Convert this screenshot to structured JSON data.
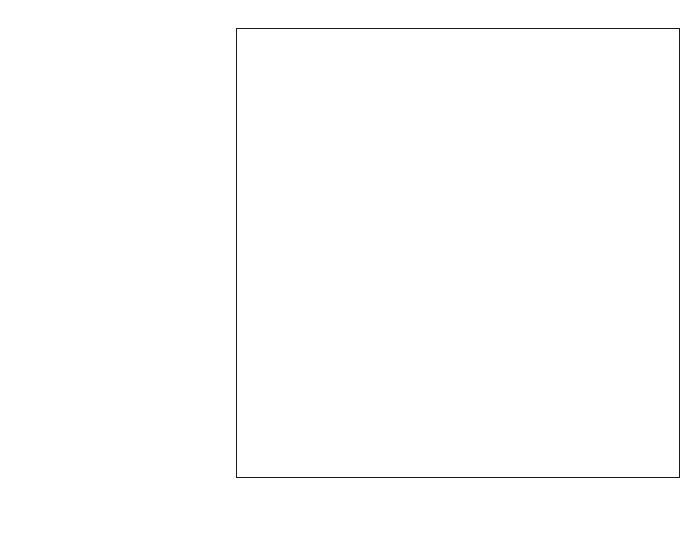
{
  "chart_data": {
    "type": "bar",
    "title": "",
    "subtitle": "",
    "orientation": "horizontal",
    "xlabel": "Sea level rise (mm/yr)",
    "ylabel": "",
    "xlim": [
      -1.5,
      2.45
    ],
    "xticks": [
      -1.0,
      -0.5,
      0.0,
      0.5,
      1.0,
      1.5,
      2.0
    ],
    "xtick_labels": [
      "-1.0",
      "-0.5",
      "0.0",
      "0.5",
      "1.0",
      "1.5",
      "2.0"
    ],
    "minor_tick_step": 0.1,
    "grid": false,
    "legend": null,
    "units": "mm/yr",
    "categories": [
      "Thermal expansion",
      "Glaciers",
      "Greenland (recent)",
      "Antarctica (recent)",
      "Ice sheets (long-term)",
      "Permafrost",
      "Sediment deposition",
      "Terrestrial storage",
      "Total",
      "Observations"
    ],
    "series": [
      {
        "name": "Sea level rise contribution range",
        "encoding": "range-box-with-central-estimate",
        "values": [
          {
            "category": "Thermal expansion",
            "low": 0.25,
            "high": 0.65,
            "central": 0.45
          },
          {
            "category": "Glaciers",
            "low": 0.15,
            "high": 0.37,
            "central": 0.25
          },
          {
            "category": "Greenland (recent)",
            "low": -0.04,
            "high": 0.08,
            "central": 0.02
          },
          {
            "category": "Antarctica (recent)",
            "low": -0.24,
            "high": -0.03,
            "central": -0.12
          },
          {
            "category": "Ice sheets (long-term)",
            "low": -0.05,
            "high": 0.5,
            "central": 0.2
          },
          {
            "category": "Permafrost",
            "low": -0.04,
            "high": 0.04,
            "central": 0.0
          },
          {
            "category": "Sediment deposition",
            "low": -0.04,
            "high": 0.04,
            "central": 0.0
          },
          {
            "category": "Terrestrial storage",
            "low": -1.1,
            "high": 0.4,
            "central": -0.35
          },
          {
            "category": "Total",
            "low": -0.8,
            "high": 2.2,
            "central": 0.7
          },
          {
            "category": "Observations",
            "low": 1.0,
            "high": 2.0,
            "central": 1.5
          }
        ]
      }
    ]
  },
  "style": {
    "bar_fill": "#c6c6c6",
    "bar_stroke": "#222222",
    "axis_color": "#1a1a1a",
    "background": "#ffffff"
  }
}
